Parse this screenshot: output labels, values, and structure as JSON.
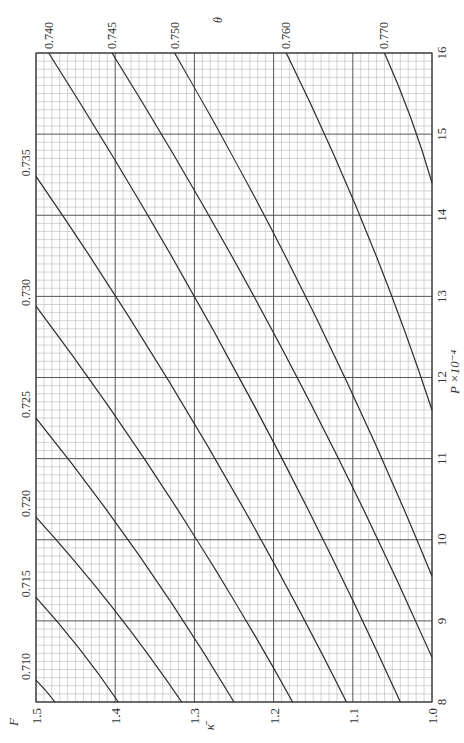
{
  "chart_data": {
    "type": "line",
    "orientation": "rotated 90deg counter-clockwise (page printed sideways)",
    "title": "",
    "xlabel": "P ×10⁻⁴",
    "ylabel": "κ̄",
    "curve_family_label": "F",
    "secondary_label": "θ",
    "xlim": [
      8,
      16
    ],
    "ylim": [
      1.0,
      1.5
    ],
    "x_ticks": [
      "8",
      "9",
      "10",
      "11",
      "12",
      "13",
      "14",
      "15",
      "16"
    ],
    "y_ticks": [
      "1.0",
      "1.1",
      "1.2",
      "1.3",
      "1.4",
      "1.5"
    ],
    "grid": {
      "major_x_step": 1,
      "minor_x_step": 0.1,
      "major_y_step": 0.1,
      "minor_y_step": 0.01
    },
    "series": [
      {
        "name": "0.710",
        "points": [
          [
            8.27,
            1.5
          ],
          [
            8.0,
            1.476
          ]
        ]
      },
      {
        "name": "0.715",
        "points": [
          [
            9.29,
            1.5
          ],
          [
            8.0,
            1.396
          ]
        ]
      },
      {
        "name": "0.720",
        "points": [
          [
            10.28,
            1.5
          ],
          [
            8.0,
            1.316
          ]
        ]
      },
      {
        "name": "0.725",
        "points": [
          [
            11.5,
            1.5
          ],
          [
            8.0,
            1.25
          ]
        ]
      },
      {
        "name": "0.730",
        "points": [
          [
            12.88,
            1.5
          ],
          [
            8.0,
            1.176
          ]
        ]
      },
      {
        "name": "0.735",
        "points": [
          [
            14.48,
            1.5
          ],
          [
            8.0,
            1.108
          ]
        ]
      },
      {
        "name": "0.740",
        "points": [
          [
            16.0,
            1.484
          ],
          [
            8.0,
            1.04
          ]
        ]
      },
      {
        "name": "0.745",
        "points": [
          [
            16.0,
            1.404
          ],
          [
            8.55,
            1.0
          ]
        ]
      },
      {
        "name": "0.750",
        "points": [
          [
            16.0,
            1.325
          ],
          [
            9.55,
            1.0
          ]
        ]
      },
      {
        "name": "0.760",
        "points": [
          [
            16.0,
            1.184
          ],
          [
            11.6,
            1.0
          ]
        ]
      },
      {
        "name": "0.770",
        "points": [
          [
            16.0,
            1.06
          ],
          [
            14.4,
            1.0
          ]
        ]
      }
    ]
  },
  "labels": {
    "x_axis": "P ×10⁻⁴",
    "y_axis": "κ̄",
    "family_F": "F",
    "family_theta": "θ"
  }
}
